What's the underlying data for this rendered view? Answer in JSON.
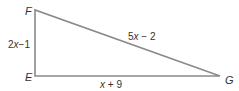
{
  "diagram": {
    "type": "right-triangle",
    "stroke_color": "#8a8a8a",
    "text_color": "#333333",
    "vertices": {
      "F": {
        "label": "F",
        "x": 35,
        "y": 10
      },
      "E": {
        "label": "E",
        "x": 35,
        "y": 76
      },
      "G": {
        "label": "G",
        "x": 220,
        "y": 76
      }
    },
    "sides": {
      "EF": {
        "coef": "2",
        "var": "x",
        "rest": "−1"
      },
      "FG": {
        "coef": "5",
        "var": "x",
        "rest": " − 2"
      },
      "EG": {
        "coef": "",
        "var": "x",
        "rest": " + 9"
      }
    }
  }
}
